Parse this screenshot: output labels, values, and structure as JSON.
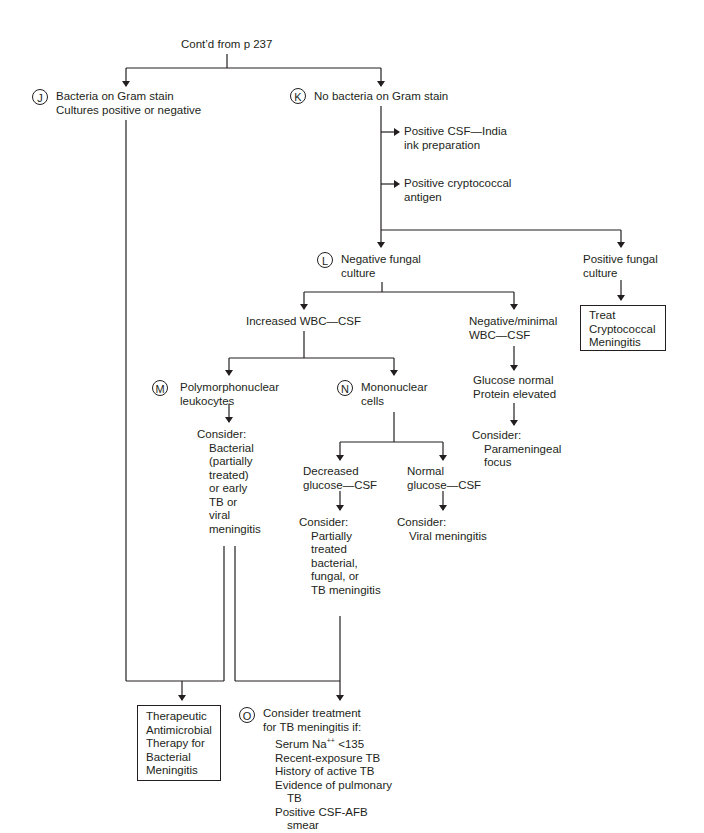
{
  "diagram": {
    "type": "flowchart",
    "topic": "Meningitis diagnostic algorithm (continued)",
    "header": "Cont’d from p 237",
    "nodes": {
      "J": {
        "letter": "J",
        "lines": [
          "Bacteria on Gram stain",
          "Cultures positive or negative"
        ]
      },
      "K": {
        "letter": "K",
        "lines": [
          "No bacteria on Gram stain"
        ]
      },
      "india_ink": {
        "lines": [
          "Positive CSF—India",
          "ink preparation"
        ]
      },
      "crypto_antigen": {
        "lines": [
          "Positive cryptococcal",
          "antigen"
        ]
      },
      "L": {
        "letter": "L",
        "lines": [
          "Negative fungal",
          "culture"
        ]
      },
      "pos_fungal": {
        "lines": [
          "Positive fungal",
          "culture"
        ]
      },
      "treat_crypto": {
        "lines": [
          "Treat",
          "Cryptococcal",
          "Meningitis"
        ]
      },
      "increased_wbc": {
        "lines": [
          "Increased WBC—CSF"
        ]
      },
      "neg_wbc": {
        "lines": [
          "Negative/minimal",
          "WBC—CSF"
        ]
      },
      "glucose_protein": {
        "lines": [
          "Glucose normal",
          "Protein elevated"
        ]
      },
      "parameningeal": {
        "lines": [
          "Consider:",
          "Parameningeal",
          "focus"
        ]
      },
      "M": {
        "letter": "M",
        "lines": [
          "Polymorphonuclear",
          "leukocytes"
        ]
      },
      "N": {
        "letter": "N",
        "lines": [
          "Mononuclear",
          "cells"
        ]
      },
      "consider_M": {
        "lines": [
          "Consider:",
          "Bacterial",
          "(partially",
          "treated)",
          "or early",
          "TB or",
          "viral",
          "meningitis"
        ]
      },
      "dec_glucose": {
        "lines": [
          "Decreased",
          "glucose—CSF"
        ]
      },
      "norm_glucose": {
        "lines": [
          "Normal",
          "glucose—CSF"
        ]
      },
      "consider_dec": {
        "lines": [
          "Consider:",
          "Partially",
          "treated",
          "bacterial,",
          "fungal, or",
          "TB meningitis"
        ]
      },
      "consider_norm": {
        "lines": [
          "Consider:",
          "Viral meningitis"
        ]
      },
      "therapeutic": {
        "lines": [
          "Therapeutic",
          "Antimicrobial",
          "Therapy for",
          "Bacterial",
          "Meningitis"
        ]
      },
      "O": {
        "letter": "O",
        "lines": [
          "Consider treatment",
          "for TB meningitis if:"
        ],
        "criteria": {
          "serum_prefix": "Serum Na",
          "serum_sup": "++",
          "serum_suffix": " <135",
          "c2": "Recent-exposure TB",
          "c3": "History of active TB",
          "c4a": "Evidence of pulmonary",
          "c4b": "TB",
          "c5a": "Positive CSF-AFB",
          "c5b": "smear"
        }
      }
    }
  }
}
